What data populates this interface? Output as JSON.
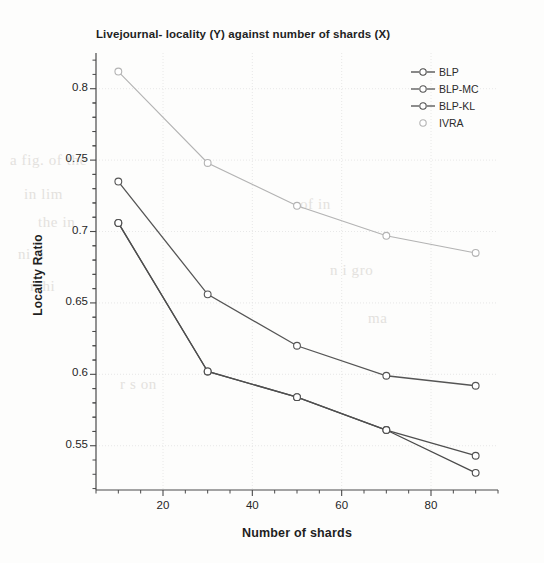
{
  "chart_data": {
    "type": "line",
    "title": "Livejournal- locality (Y) against number of shards (X)",
    "xlabel": "Number of shards",
    "ylabel": "Locality Ratio",
    "x": [
      10,
      30,
      50,
      70,
      90
    ],
    "xlim": [
      5,
      95
    ],
    "ylim": [
      0.519,
      0.825
    ],
    "xticks": [
      20,
      40,
      60,
      80
    ],
    "xtick_labels": [
      "20",
      "40",
      "60",
      "80"
    ],
    "yticks": [
      0.55,
      0.6,
      0.65,
      0.7,
      0.75,
      0.8
    ],
    "ytick_labels": [
      "0.55",
      "0.6",
      "0.65",
      "0.7",
      "0.75",
      "0.8"
    ],
    "grid": true,
    "legend_position": "top-right",
    "series": [
      {
        "name": "BLP",
        "color": "#4a4a4a",
        "marker": "open-circle",
        "values": [
          0.706,
          0.602,
          0.584,
          0.561,
          0.531
        ]
      },
      {
        "name": "BLP-MC",
        "color": "#555555",
        "marker": "open-circle",
        "values": [
          0.735,
          0.656,
          0.62,
          0.599,
          0.592
        ]
      },
      {
        "name": "BLP-KL",
        "color": "#4f4f4f",
        "marker": "open-circle",
        "values": [
          0.706,
          0.602,
          0.584,
          0.561,
          0.543
        ]
      },
      {
        "name": "IVRA",
        "color": "#b3b3b3",
        "marker": "open-circle",
        "values": [
          0.812,
          0.748,
          0.718,
          0.697,
          0.685
        ]
      }
    ]
  },
  "legend": {
    "items": [
      {
        "label": "BLP"
      },
      {
        "label": "BLP-MC"
      },
      {
        "label": "BLP-KL"
      },
      {
        "label": "IVRA"
      }
    ]
  },
  "background_text": {
    "lines": [
      "a fig. of the",
      "in lim",
      "the in",
      "ni ti",
      "n hi",
      "of in",
      "n i gro",
      "ma",
      "r s on"
    ]
  }
}
